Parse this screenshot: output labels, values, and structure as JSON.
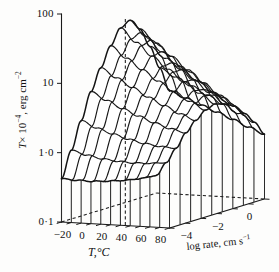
{
  "figure": {
    "kind": "3d-surface-wireframe",
    "background_color": "#fdfdfc",
    "line_color": "#181818"
  },
  "axes": {
    "y": {
      "symbol": "T",
      "title_prefix": "× 10",
      "title_exponent": "−4",
      "title_suffix": ", erg cm",
      "title_suffix_exponent": "−2",
      "scale": "log",
      "ticks": [
        "100",
        "10",
        "1·0",
        "0·1"
      ],
      "tick_values": [
        100,
        10,
        1.0,
        0.1
      ],
      "range": [
        0.1,
        100
      ]
    },
    "x": {
      "title": "T,°C",
      "ticks": [
        "−20",
        "0",
        "20",
        "40",
        "60",
        "80"
      ],
      "tick_values": [
        -20,
        0,
        20,
        40,
        60,
        80
      ],
      "range": [
        -20,
        90
      ],
      "minor_tick_step": 10
    },
    "z": {
      "title": "log rate, cm s",
      "title_exponent": "−1",
      "ticks": [
        "−4",
        "−2",
        "0"
      ],
      "tick_values": [
        -4,
        -2,
        0
      ],
      "range": [
        -5,
        1
      ],
      "minor_tick_step": 1
    }
  },
  "chart_data": {
    "type": "surface",
    "title": "",
    "xlabel": "T,°C",
    "ylabel": "T × 10⁻⁴, erg cm⁻²",
    "zlabel": "log rate, cm s⁻¹",
    "xlim": [
      -20,
      90
    ],
    "ylim": [
      0.1,
      100
    ],
    "zlim": [
      -5,
      1
    ],
    "grid": false,
    "legend": "none",
    "x": [
      -20,
      -10,
      0,
      10,
      20,
      30,
      40,
      50,
      60,
      70,
      80,
      90
    ],
    "z": [
      -5,
      -4,
      -3,
      -2,
      -1,
      0,
      1
    ],
    "peak": {
      "x": 45,
      "z": -5,
      "value": 95
    },
    "annotations": [
      "dashed vertical line from surface peak down to base plane",
      "dashed contour line on base plane at value 0·1",
      "vertical drop lines from front surface edge to base plane"
    ],
    "values": [
      [
        0.42,
        0.34,
        0.28,
        0.24,
        0.21,
        0.19,
        0.18
      ],
      [
        1.1,
        0.8,
        0.6,
        0.47,
        0.38,
        0.32,
        0.28
      ],
      [
        3.0,
        2.0,
        1.4,
        1.0,
        0.74,
        0.57,
        0.46
      ],
      [
        8.0,
        5.1,
        3.3,
        2.2,
        1.5,
        1.05,
        0.78
      ],
      [
        18.0,
        11.0,
        6.8,
        4.2,
        2.7,
        1.75,
        1.2
      ],
      [
        38.0,
        21.5,
        12.5,
        7.3,
        4.4,
        2.7,
        1.72
      ],
      [
        70.0,
        37.0,
        20.0,
        11.0,
        6.2,
        3.6,
        2.15
      ],
      [
        92.0,
        46.0,
        23.5,
        12.4,
        6.7,
        3.75,
        2.18
      ],
      [
        70.0,
        37.5,
        20.5,
        11.2,
        6.2,
        3.5,
        2.05
      ],
      [
        40.0,
        23.0,
        13.5,
        7.9,
        4.6,
        2.72,
        1.65
      ],
      [
        20.0,
        12.6,
        8.0,
        5.05,
        3.15,
        1.97,
        1.25
      ],
      [
        9.5,
        6.4,
        4.3,
        2.9,
        1.94,
        1.28,
        0.86
      ]
    ]
  }
}
